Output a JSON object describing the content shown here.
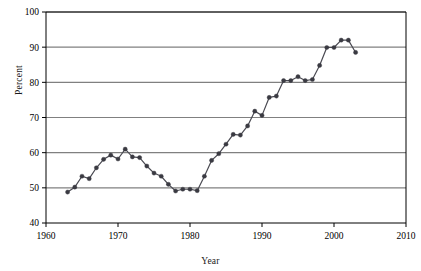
{
  "chart_data": {
    "type": "line",
    "title": "",
    "subtitle": "",
    "xlabel": "Year",
    "ylabel": "Percent",
    "xlim": [
      1960,
      2010
    ],
    "ylim": [
      40,
      100
    ],
    "xticks": [
      1960,
      1970,
      1980,
      1990,
      2000,
      2010
    ],
    "xticklabels": [
      "1960",
      "1970",
      "1980",
      "1990",
      "2000",
      "2010"
    ],
    "yticks": [
      40,
      50,
      60,
      70,
      80,
      90,
      100
    ],
    "yticklabels": [
      "40",
      "50",
      "60",
      "70",
      "80",
      "90",
      "100"
    ],
    "grid": "horizontal",
    "legend": "none",
    "marker": "filled-circle",
    "line_color": "#4a4a52",
    "marker_color": "#3a3a42",
    "grid_color": "#808080",
    "axis_color": "#000000",
    "x": [
      1963,
      1964,
      1965,
      1966,
      1967,
      1968,
      1969,
      1970,
      1971,
      1972,
      1973,
      1974,
      1975,
      1976,
      1977,
      1978,
      1979,
      1980,
      1981,
      1982,
      1983,
      1984,
      1985,
      1986,
      1987,
      1988,
      1989,
      1990,
      1991,
      1992,
      1993,
      1994,
      1995,
      1996,
      1997,
      1998,
      1999,
      2000,
      2001,
      2002,
      2003
    ],
    "values": [
      48.8,
      50.2,
      53.3,
      52.6,
      55.7,
      58.1,
      59.3,
      58.2,
      61.0,
      58.8,
      58.6,
      56.2,
      54.2,
      53.3,
      51.0,
      49.1,
      49.6,
      49.6,
      49.2,
      53.3,
      57.8,
      59.7,
      62.4,
      65.2,
      65.0,
      67.6,
      71.8,
      70.6,
      75.7,
      76.1,
      80.5,
      80.5,
      81.6,
      80.5,
      80.8,
      84.8,
      89.9,
      89.9,
      92.0,
      92.0,
      88.5
    ],
    "series": [
      {
        "name": "Percent",
        "values": [
          48.8,
          50.2,
          53.3,
          52.6,
          55.7,
          58.1,
          59.3,
          58.2,
          61.0,
          58.8,
          58.6,
          56.2,
          54.2,
          53.3,
          51.0,
          49.1,
          49.6,
          49.6,
          49.2,
          53.3,
          57.8,
          59.7,
          62.4,
          65.2,
          65.0,
          67.6,
          71.8,
          70.6,
          75.7,
          76.1,
          80.5,
          80.5,
          81.6,
          80.5,
          80.8,
          84.8,
          89.9,
          89.9,
          92.0,
          92.0,
          88.5
        ]
      }
    ]
  }
}
